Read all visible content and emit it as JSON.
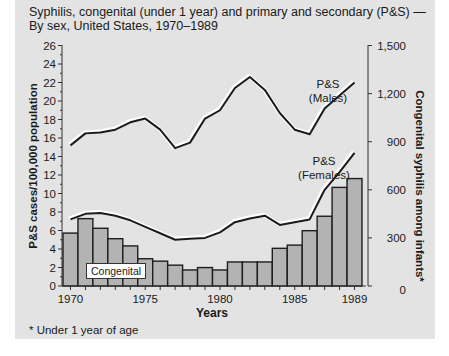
{
  "title_line1": "Syphilis, congenital (under 1 year) and primary and secondary (P&S) —",
  "title_line2": "By sex, United States, 1970–1989",
  "footnote": "* Under 1 year of age",
  "colors": {
    "panel": "#e3e3e3",
    "bar_fill": "#b3b3b3",
    "line": "#1a1a1a",
    "label_box": "#ffffff"
  },
  "chart_data": {
    "type": "bar+line",
    "title": "Syphilis, congenital (under 1 year) and primary and secondary (P&S) — By sex, United States, 1970–1989",
    "xlabel": "Years",
    "ylabel_left": "P&S cases/100,000 population",
    "ylabel_right": "Congenital syphilis among infants*",
    "x": [
      1970,
      1971,
      1972,
      1973,
      1974,
      1975,
      1976,
      1977,
      1978,
      1979,
      1980,
      1981,
      1982,
      1983,
      1984,
      1985,
      1986,
      1987,
      1988,
      1989
    ],
    "x_tick_labels": [
      "1970",
      "1975",
      "1980",
      "1985",
      "1989"
    ],
    "y_left_ticks": [
      0,
      2,
      4,
      6,
      8,
      10,
      12,
      14,
      16,
      18,
      20,
      22,
      24,
      26
    ],
    "y_left_lim": [
      0,
      26
    ],
    "y_right_ticks": [
      "0",
      "300",
      "600",
      "900",
      "1,200",
      "1,500"
    ],
    "y_right_lim": [
      0,
      1500
    ],
    "grid": false,
    "series": [
      {
        "name": "P&S (Males)",
        "type": "line",
        "axis": "left",
        "values": [
          15.2,
          16.5,
          16.6,
          16.9,
          17.7,
          18.1,
          16.9,
          14.9,
          15.5,
          18.1,
          19.0,
          21.4,
          22.6,
          21.2,
          18.7,
          16.9,
          16.4,
          19.2,
          20.6,
          22.0
        ]
      },
      {
        "name": "P&S (Females)",
        "type": "line",
        "axis": "left",
        "values": [
          7.2,
          7.8,
          7.9,
          7.6,
          7.1,
          6.4,
          5.7,
          5.0,
          5.1,
          5.2,
          5.8,
          6.9,
          7.3,
          7.6,
          6.6,
          6.9,
          7.2,
          10.4,
          12.3,
          14.4
        ]
      },
      {
        "name": "Congenital",
        "type": "bar",
        "axis": "right",
        "values": [
          330,
          420,
          360,
          295,
          250,
          170,
          155,
          130,
          100,
          115,
          100,
          150,
          150,
          150,
          235,
          255,
          345,
          435,
          615,
          670
        ]
      }
    ],
    "annotations": [
      "P&S (Males)",
      "P&S (Females)",
      "Congenital"
    ]
  },
  "labels": {
    "males_1": "P&S",
    "males_2": "(Males)",
    "females_1": "P&S",
    "females_2": "(Females)",
    "congenital": "Congenital"
  }
}
